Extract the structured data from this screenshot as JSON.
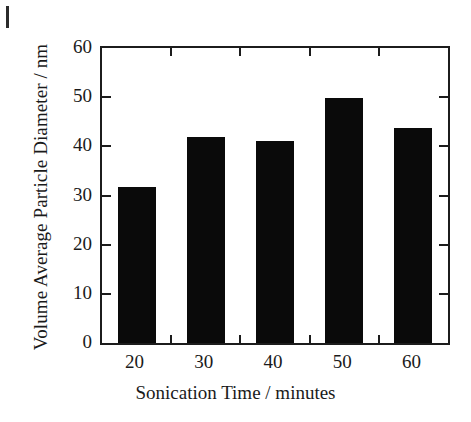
{
  "chart_data": {
    "type": "bar",
    "title": "",
    "xlabel": "Sonication Time / minutes",
    "ylabel": "Volume Average Particle Diameter / nm",
    "categories": [
      "20",
      "30",
      "40",
      "50",
      "60"
    ],
    "values": [
      31.7,
      42.0,
      41.0,
      49.8,
      43.7
    ],
    "series": [
      {
        "name": "Volume Average Particle Diameter",
        "values": [
          31.7,
          42.0,
          41.0,
          49.8,
          43.7
        ]
      }
    ],
    "ylim": [
      0,
      60
    ],
    "ytick_labels": [
      "0",
      "10",
      "20",
      "30",
      "40",
      "50",
      "60"
    ],
    "ytick_values": [
      0,
      10,
      20,
      30,
      40,
      50,
      60
    ],
    "xtick_labels": [
      "20",
      "30",
      "40",
      "50",
      "60"
    ],
    "grid": false,
    "legend": false,
    "legend_position": "none",
    "bar_color": "#0a0a0a",
    "axis_color": "#1c1c1c",
    "background_color": "#ffffff",
    "tick_direction": "in"
  },
  "figure": {
    "corner_mark": ""
  }
}
